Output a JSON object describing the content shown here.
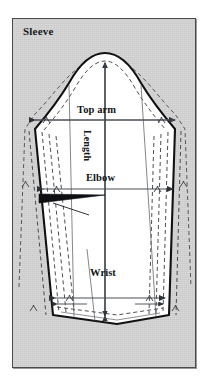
{
  "panel": {
    "title": "Sleeve",
    "background_color": "#d2d2d2",
    "border_color": "#4a4a4a"
  },
  "diagram": {
    "type": "sewing-pattern",
    "piece": "sleeve",
    "fill_color": "#ffffff",
    "outline_color": "#111111",
    "guide_color": "#3a3a3a",
    "grading_line_style": "dashed",
    "labels": {
      "top_arm": "Top arm",
      "length": "Length",
      "elbow": "Elbow",
      "wrist": "Wrist"
    },
    "features": [
      "sleeve-cap-curve",
      "seam-allowance-dashed-line",
      "grading-nest-lines",
      "elbow-dart",
      "grainline-arrow",
      "hem-fold-line"
    ],
    "measurement_lines": [
      {
        "name": "top-arm",
        "orientation": "horizontal",
        "arrows": "both"
      },
      {
        "name": "length",
        "orientation": "vertical",
        "arrows": "both"
      },
      {
        "name": "elbow",
        "orientation": "horizontal",
        "arrows": "both"
      },
      {
        "name": "wrist",
        "orientation": "horizontal",
        "arrows": "both"
      }
    ]
  }
}
